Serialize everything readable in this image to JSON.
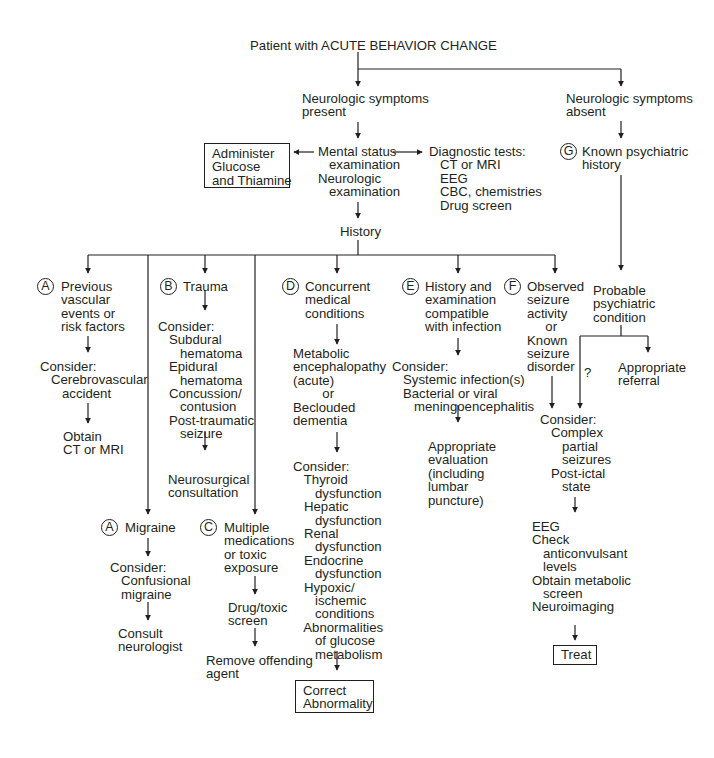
{
  "title": "Patient with ACUTE BEHAVIOR CHANGE",
  "branches": {
    "present": "Neurologic symptoms\npresent",
    "absent": "Neurologic symptoms\nabsent"
  },
  "exam": "Mental status\n   examination\nNeurologic\n   examination",
  "glucose_box": "Administer\nGlucose\nand Thiamine",
  "diagnostic": "Diagnostic tests:\n   CT or MRI\n   EEG\n   CBC, chemistries\n   Drug screen",
  "history": "History",
  "G": {
    "letter": "G",
    "label": "Known psychiatric\nhistory",
    "probable": "Probable\npsychiatric\ncondition",
    "referral": "Appropriate\nreferral",
    "question": "?"
  },
  "A1": {
    "letter": "A",
    "label": "Previous\nvascular\nevents or\nrisk factors",
    "consider": "Consider:\n   Cerebrovascular\n      accident",
    "action": "Obtain\nCT or MRI"
  },
  "B": {
    "letter": "B",
    "label": "Trauma",
    "consider": "Consider:\n   Subdural\n      hematoma\n   Epidural\n      hematoma\n   Concussion/\n      contusion\n   Post-traumatic\n      seizure",
    "action": "Neurosurgical\nconsultation"
  },
  "A2": {
    "letter": "A",
    "label": "Migraine",
    "consider": "Consider:\n   Confusional\n   migraine",
    "action": "Consult\nneurologist"
  },
  "C": {
    "letter": "C",
    "label": "Multiple\nmedications\nor toxic\nexposure",
    "screen": "Drug/toxic\nscreen",
    "action": "Remove offending\nagent"
  },
  "D": {
    "letter": "D",
    "label": "Concurrent\nmedical\nconditions",
    "metabolic": "Metabolic\nencephalopathy\n(acute)\n        or\nBeclouded\ndementia",
    "consider": "Consider:\n   Thyroid\n      dysfunction\n   Hepatic\n      dysfunction\n   Renal\n      dysfunction\n   Endocrine\n      dysfunction\n   Hypoxic/\n      ischemic\n      conditions\n   Abnormalities\n      of glucose\n      metabolism",
    "action_box": "Correct\nAbnormality"
  },
  "E": {
    "letter": "E",
    "label": "History and\nexamination\ncompatible\nwith infection",
    "consider": "Consider:\n   Systemic infection(s)\n   Bacterial or viral\n      meningoencephalitis",
    "action": "Appropriate\nevaluation\n(including\nlumbar\npuncture)"
  },
  "F": {
    "letter": "F",
    "label": "Observed\nseizure\nactivity\n     or\nKnown\nseizure\ndisorder",
    "consider": "Consider:\n   Complex\n      partial\n      seizures\n   Post-ictal\n      state",
    "workup": "EEG\nCheck\n   anticonvulsant\n   levels\nObtain metabolic\n   screen\nNeuroimaging",
    "action_box": "Treat"
  },
  "colors": {
    "ink": "#231f20",
    "background": "#ffffff"
  }
}
